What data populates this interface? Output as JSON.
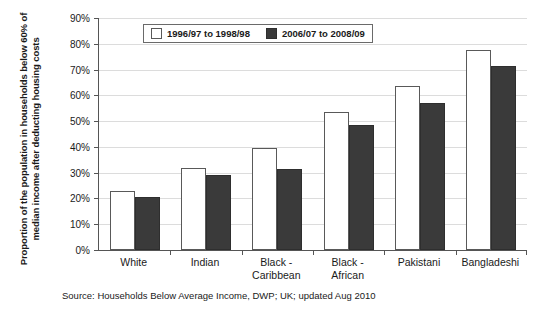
{
  "chart_data": {
    "type": "bar",
    "title": "",
    "subtitle": "",
    "xlabel": "",
    "ylabel": "Proportion of the population in households below 60% of median income after deducting housing costs",
    "ylim": [
      0,
      90
    ],
    "ytick_step": 10,
    "ytick_labels": [
      "90%",
      "80%",
      "70%",
      "60%",
      "50%",
      "40%",
      "30%",
      "20%",
      "10%",
      "0%"
    ],
    "ytick_values": [
      90,
      80,
      70,
      60,
      50,
      40,
      30,
      20,
      10,
      0
    ],
    "grid": true,
    "legend_position": "top-center-inside",
    "categories": [
      "White",
      "Indian",
      "Black -\nCaribbean",
      "Black -\nAfrican",
      "Pakistani",
      "Bangladeshi"
    ],
    "series": [
      {
        "name": "1996/97 to 1998/98",
        "color": "#ffffff",
        "edge_color": "#595959",
        "values": [
          23,
          32,
          39.5,
          53.5,
          63.5,
          77.5
        ]
      },
      {
        "name": "2006/07 to 2008/09",
        "color": "#3a3a3a",
        "edge_color": "#2e2e2e",
        "values": [
          20.5,
          29,
          31.5,
          48.5,
          57,
          71.5
        ]
      }
    ],
    "annotations": [
      "Source: Households Below Average Income, DWP; UK; updated Aug 2010"
    ]
  },
  "axis": {
    "y_title": "Proportion of the population in households below 60% of median income after deducting housing costs"
  },
  "legend": {
    "items": [
      {
        "label": "1996/97 to 1998/98",
        "swatch": "white-square"
      },
      {
        "label": "2006/07 to 2008/09",
        "swatch": "dark-square"
      }
    ]
  },
  "footer": {
    "source": "Source: Households Below Average Income, DWP; UK; updated Aug 2010"
  },
  "colors": {
    "series_a_fill": "#ffffff",
    "series_a_edge": "#595959",
    "series_b_fill": "#3a3a3a",
    "series_b_edge": "#2e2e2e",
    "gridline": "#dcdcdc",
    "axis": "#555555",
    "background": "#ffffff"
  }
}
